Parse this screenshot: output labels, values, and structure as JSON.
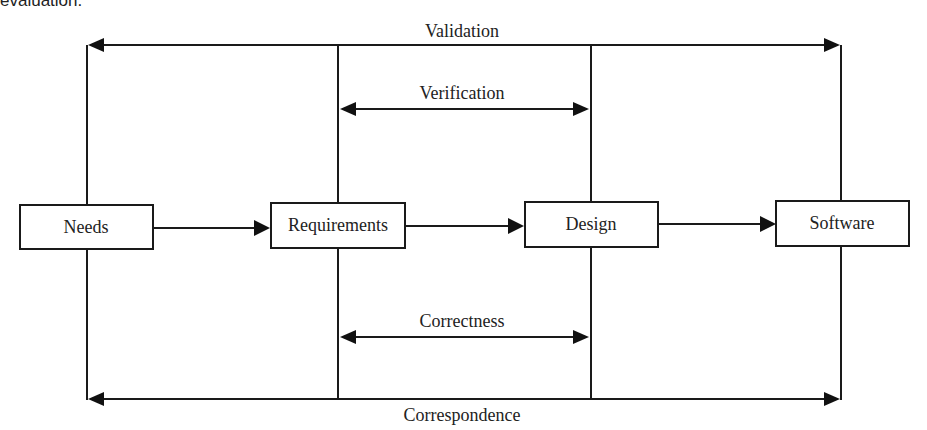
{
  "caption_fragment": "evaluation.",
  "diagram": {
    "nodes": [
      {
        "id": "needs",
        "label": "Needs"
      },
      {
        "id": "requirements",
        "label": "Requirements"
      },
      {
        "id": "design",
        "label": "Design"
      },
      {
        "id": "software",
        "label": "Software"
      }
    ],
    "flow_edges": [
      {
        "from": "needs",
        "to": "requirements"
      },
      {
        "from": "requirements",
        "to": "design"
      },
      {
        "from": "design",
        "to": "software"
      }
    ],
    "relations": [
      {
        "label": "Validation",
        "between": [
          "needs",
          "software"
        ],
        "position": "top-outer"
      },
      {
        "label": "Verification",
        "between": [
          "requirements",
          "design"
        ],
        "position": "top-inner"
      },
      {
        "label": "Correctness",
        "between": [
          "requirements",
          "design"
        ],
        "position": "bottom-inner"
      },
      {
        "label": "Correspondence",
        "between": [
          "needs",
          "software"
        ],
        "position": "bottom-outer"
      }
    ],
    "colors": {
      "stroke": "#1a1a1a",
      "background": "#ffffff"
    }
  }
}
